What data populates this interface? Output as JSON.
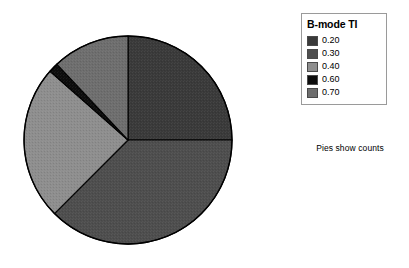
{
  "chart_data": {
    "type": "pie",
    "title": "",
    "legend_title": "B-mode TI",
    "legend_position": "right",
    "caption": "Pies show counts",
    "value_units": "counts",
    "start_angle_deg": 0,
    "direction": "clockwise",
    "categories": [
      "0.20",
      "0.30",
      "0.40",
      "0.60",
      "0.70"
    ],
    "values": [
      25.0,
      37.5,
      24.0,
      1.5,
      12.0
    ],
    "colors": [
      "#3a3a3a",
      "#4e4e4e",
      "#8e8e8e",
      "#0d0d0d",
      "#6e6e6e"
    ],
    "slices": [
      {
        "label": "0.20",
        "value": 25.0,
        "color": "#3a3a3a",
        "start_deg": 0,
        "end_deg": 90.0
      },
      {
        "label": "0.30",
        "value": 37.5,
        "color": "#4e4e4e",
        "start_deg": 90.0,
        "end_deg": 225.0
      },
      {
        "label": "0.40",
        "value": 24.0,
        "color": "#8e8e8e",
        "start_deg": 225.0,
        "end_deg": 311.4
      },
      {
        "label": "0.60",
        "value": 1.5,
        "color": "#0d0d0d",
        "start_deg": 311.4,
        "end_deg": 316.8
      },
      {
        "label": "0.70",
        "value": 12.0,
        "color": "#6e6e6e",
        "start_deg": 316.8,
        "end_deg": 360.0
      }
    ]
  },
  "legend": {
    "title": "B-mode TI",
    "entries": [
      {
        "label": "0.20",
        "color": "#3a3a3a"
      },
      {
        "label": "0.30",
        "color": "#4e4e4e"
      },
      {
        "label": "0.40",
        "color": "#8e8e8e"
      },
      {
        "label": "0.60",
        "color": "#0d0d0d"
      },
      {
        "label": "0.70",
        "color": "#6e6e6e"
      }
    ]
  },
  "caption": {
    "text": "Pies show counts"
  },
  "pie_geometry": {
    "center_x": 128,
    "center_y": 140,
    "radius": 104,
    "outline_color": "#000000"
  }
}
